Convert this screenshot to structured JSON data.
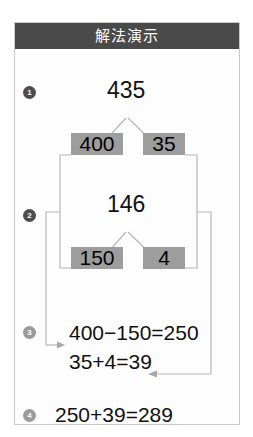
{
  "header": {
    "title": "解法演示"
  },
  "steps": [
    {
      "marker": "1",
      "style": "dark"
    },
    {
      "marker": "2",
      "style": "dark"
    },
    {
      "marker": "3",
      "style": "light"
    },
    {
      "marker": "4",
      "style": "light"
    }
  ],
  "tree_one": {
    "root": "435",
    "left_child": "400",
    "right_child": "35"
  },
  "tree_two": {
    "root": "146",
    "left_child": "150",
    "right_child": "4"
  },
  "step_three": {
    "line_one": "400−150=250",
    "line_two": "35+4=39"
  },
  "step_four": {
    "line_one": "250+39=289"
  },
  "colors": {
    "header_background": "#4a4a4a",
    "header_text": "#ffffff",
    "highlight_background": "#9d9d9d",
    "marker_dark": "#4d4d4d",
    "marker_light": "#9a9a9a",
    "connector_line": "#b0b0b0",
    "card_border": "#c9c9c9",
    "text": "#111111"
  }
}
